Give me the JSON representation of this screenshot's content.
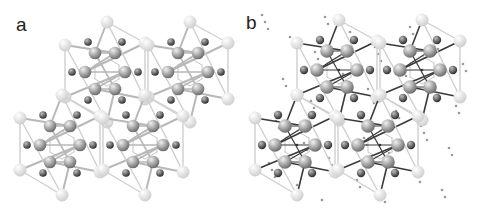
{
  "figure": {
    "panels": [
      {
        "id": "a",
        "label": "a",
        "style": "light"
      },
      {
        "id": "b",
        "label": "b",
        "style": "dark"
      }
    ]
  },
  "structure": {
    "cluster_centers_a": [
      [
        107,
        72
      ],
      [
        190,
        72
      ],
      [
        62,
        145
      ],
      [
        145,
        145
      ]
    ],
    "cluster_centers_b": [
      [
        97,
        70
      ],
      [
        180,
        70
      ],
      [
        55,
        145
      ],
      [
        138,
        145
      ]
    ],
    "ring_atoms": [
      [
        -12,
        -19
      ],
      [
        8,
        -19
      ],
      [
        -22,
        0
      ],
      [
        18,
        0
      ],
      [
        -12,
        17
      ],
      [
        8,
        17
      ]
    ],
    "outer_dark_atoms": [
      [
        -19,
        -30
      ],
      [
        15,
        -30
      ],
      [
        -35,
        0
      ],
      [
        31,
        0
      ],
      [
        -19,
        28
      ],
      [
        15,
        28
      ]
    ],
    "light_atoms": [
      [
        0,
        -50
      ],
      [
        -42,
        -27
      ],
      [
        38,
        -29
      ],
      [
        -42,
        25
      ],
      [
        38,
        27
      ],
      [
        0,
        50
      ]
    ],
    "colors": {
      "light_atom": "#f2f2f2",
      "ring_atom": "#a8a8a8",
      "dark_atom": "#5a5a5a",
      "bond_light": "#b8b8b8",
      "bond_dark": "#3a3a3a",
      "dot": "#9a9a9a"
    }
  }
}
